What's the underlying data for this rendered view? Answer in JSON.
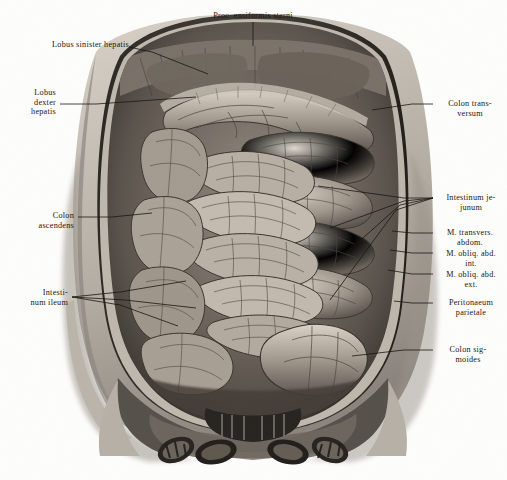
{
  "plate": {
    "title": "Proc. ensiformis sterni",
    "subject": "Situs viscerum abdominis — anterior abdominal wall reflected",
    "style": "monochrome halftone engraving",
    "width": 507,
    "height": 480,
    "background_color": "#fdfdfb",
    "ink_color": "#1a1713"
  },
  "labels": {
    "top": [
      {
        "id": "proc-ensiformis-sterni",
        "text": "Proc. ensiformis sterni",
        "align": "center",
        "x": 196,
        "y": 11,
        "lead": [
          [
            253,
            22
          ],
          [
            253,
            46
          ]
        ]
      }
    ],
    "left": [
      {
        "id": "lobus-sinister-hepatis",
        "text": "Lobus sinister hepatis",
        "align": "right",
        "x": 16,
        "y": 40,
        "lead": [
          [
            129,
            47
          ],
          [
            152,
            52
          ],
          [
            208,
            74
          ]
        ]
      },
      {
        "id": "lobus-dexter-hepatis",
        "text": "Lobus\ndexter\nhepatis",
        "align": "right",
        "x": 14,
        "y": 88,
        "lead": [
          [
            60,
            104
          ],
          [
            96,
            104
          ],
          [
            196,
            97
          ]
        ]
      },
      {
        "id": "colon-ascendens",
        "text": "Colon\nascendens",
        "align": "right",
        "x": 20,
        "y": 211,
        "lead": [
          [
            78,
            217
          ],
          [
            112,
            217
          ],
          [
            152,
            213
          ]
        ]
      },
      {
        "id": "intestinum-ileum",
        "text": "Intesti-\nnum ileum",
        "align": "right",
        "x": 10,
        "y": 288,
        "lead": [
          [
            72,
            297
          ],
          [
            120,
            292
          ],
          [
            186,
            281
          ]
        ],
        "lead2": [
          [
            72,
            297
          ],
          [
            125,
            300
          ],
          [
            196,
            308
          ]
        ],
        "lead3": [
          [
            72,
            297
          ],
          [
            120,
            305
          ],
          [
            178,
            326
          ]
        ]
      }
    ],
    "right": [
      {
        "id": "colon-transversum",
        "text": "Colon trans-\nversum",
        "align": "left",
        "x": 437,
        "y": 99,
        "lead": [
          [
            433,
            104
          ],
          [
            412,
            104
          ],
          [
            372,
            110
          ]
        ]
      },
      {
        "id": "intestinum-jejunum",
        "text": "Intestinum je-\njunum",
        "align": "left",
        "x": 437,
        "y": 193,
        "lead": [
          [
            433,
            198
          ],
          [
            404,
            198
          ],
          [
            318,
            186
          ]
        ],
        "lead2": [
          [
            433,
            198
          ],
          [
            404,
            201
          ],
          [
            330,
            228
          ]
        ],
        "lead3": [
          [
            433,
            198
          ],
          [
            400,
            205
          ],
          [
            336,
            262
          ]
        ],
        "lead4": [
          [
            433,
            198
          ],
          [
            396,
            210
          ],
          [
            330,
            300
          ]
        ]
      },
      {
        "id": "m-transvers-abdom",
        "text": "M. transvers.\nabdom.",
        "align": "left",
        "x": 437,
        "y": 228,
        "lead": [
          [
            433,
            233
          ],
          [
            412,
            233
          ],
          [
            392,
            231
          ]
        ]
      },
      {
        "id": "m-obliq-abd-int",
        "text": "M. obliq. abd.\nint.",
        "align": "left",
        "x": 437,
        "y": 248,
        "lead": [
          [
            433,
            253
          ],
          [
            412,
            253
          ],
          [
            390,
            250
          ]
        ]
      },
      {
        "id": "m-obliq-abd-ext",
        "text": "M. obliq. abd.\next.",
        "align": "left",
        "x": 437,
        "y": 269,
        "lead": [
          [
            433,
            274
          ],
          [
            412,
            274
          ],
          [
            388,
            270
          ]
        ]
      },
      {
        "id": "peritonaeum-parietale",
        "text": "Peritonaeum\nparietale",
        "align": "left",
        "x": 437,
        "y": 298,
        "lead": [
          [
            433,
            303
          ],
          [
            412,
            303
          ],
          [
            394,
            301
          ]
        ]
      },
      {
        "id": "colon-sigmoides",
        "text": "Colon sig-\nmoides",
        "align": "left",
        "x": 437,
        "y": 345,
        "lead": [
          [
            433,
            350
          ],
          [
            404,
            350
          ],
          [
            352,
            356
          ]
        ]
      }
    ]
  },
  "structures": [
    {
      "id": "thoracic-wall-flap",
      "name": "reflected thoracic / abdominal wall flap"
    },
    {
      "id": "liver-left-lobe",
      "name": "Lobus sinister hepatis"
    },
    {
      "id": "liver-right-lobe",
      "name": "Lobus dexter hepatis"
    },
    {
      "id": "transverse-colon",
      "name": "Colon transversum"
    },
    {
      "id": "greater-omentum",
      "name": "Omentum majus"
    },
    {
      "id": "jejunal-loops",
      "name": "Intestinum jejunum"
    },
    {
      "id": "ileal-loops",
      "name": "Intestinum ileum"
    },
    {
      "id": "ascending-colon",
      "name": "Colon ascendens"
    },
    {
      "id": "sigmoid-colon",
      "name": "Colon sigmoides"
    },
    {
      "id": "parietal-peritoneum",
      "name": "Peritonaeum parietale"
    },
    {
      "id": "abdominal-muscle-layers",
      "name": "M. transversus / obliquus abd. int. / obliquus abd. ext."
    },
    {
      "id": "pelvic-region",
      "name": "pelvis with reflected skin flaps"
    }
  ]
}
